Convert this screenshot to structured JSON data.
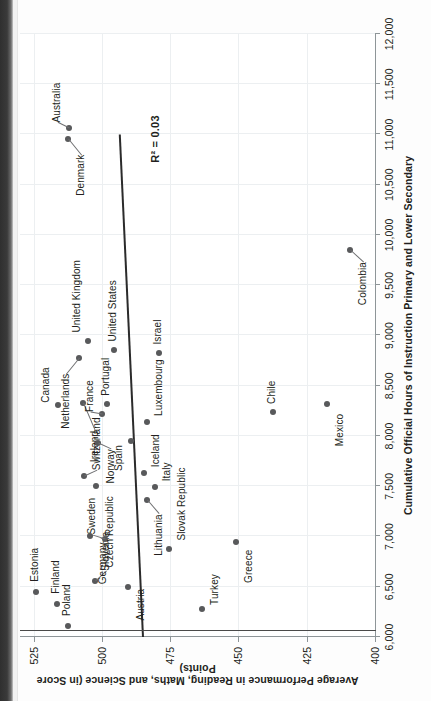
{
  "chart_data": {
    "type": "scatter",
    "title": "",
    "xlabel": "Cumulative Official Hours of Instruction Primary and Lower Secondary",
    "ylabel": "Average Performance in Reading, Maths, and Science (in Score Points)",
    "xlim": [
      6000,
      12000
    ],
    "ylim": [
      400,
      530
    ],
    "xticks": [
      "6,000",
      "6,500",
      "7,000",
      "7,500",
      "8,000",
      "8,500",
      "9,000",
      "9,500",
      "10,000",
      "10,500",
      "11,000",
      "11,500",
      "12,000"
    ],
    "xtick_values": [
      6000,
      6500,
      7000,
      7500,
      8000,
      8500,
      9000,
      9500,
      10000,
      10500,
      11000,
      11500,
      12000
    ],
    "yticks": [
      "400",
      "425",
      "450",
      "475",
      "500",
      "525"
    ],
    "ytick_values": [
      400,
      425,
      450,
      475,
      500,
      525
    ],
    "grid": true,
    "legend": "none",
    "annotation": "R² = 0.03",
    "trendline": {
      "x0": 6000,
      "y0": 485.5,
      "x1": 11000,
      "y1": 494.0
    },
    "refline": {
      "x": 6000,
      "note": "vertical axis guide at left edge of plot"
    },
    "points": [
      {
        "label": "Estonia",
        "x": 6450,
        "y": 524.0,
        "label_dx": 10,
        "label_dy": -1,
        "leader": false
      },
      {
        "label": "Finland",
        "x": 6330,
        "y": 516.5,
        "label_dx": 10,
        "label_dy": -1,
        "leader": false
      },
      {
        "label": "Poland",
        "x": 6110,
        "y": 512.5,
        "label_dx": 10,
        "label_dy": -1,
        "leader": false
      },
      {
        "label": "Canada",
        "x": 8310,
        "y": 516.0,
        "label_dx": 2,
        "label_dy": -12,
        "leader": false
      },
      {
        "label": "Slovenia",
        "x": 6560,
        "y": 502.5,
        "label_dx": 10,
        "label_dy": 11,
        "leader": true
      },
      {
        "label": "Sweden",
        "x": 6980,
        "y": 499.0,
        "label_dx": 4,
        "label_dy": -13,
        "leader": true
      },
      {
        "label": "Germany",
        "x": 7000,
        "y": 504.5,
        "label_dx": -6,
        "label_dy": 13,
        "leader": false
      },
      {
        "label": "Switzerland",
        "x": 7600,
        "y": 506.5,
        "label_dx": 6,
        "label_dy": 13,
        "leader": true
      },
      {
        "label": "Czech Republic",
        "x": 7500,
        "y": 502.0,
        "label_dx": -10,
        "label_dy": 14,
        "leader": false
      },
      {
        "label": "Ireland",
        "x": 8330,
        "y": 507.0,
        "label_dx": -28,
        "label_dy": 12,
        "leader": true
      },
      {
        "label": "Netherlands",
        "x": 8780,
        "y": 508.5,
        "label_dx": -16,
        "label_dy": -13,
        "leader": true
      },
      {
        "label": "United Kingdom",
        "x": 8950,
        "y": 505.0,
        "label_dx": 8,
        "label_dy": -11,
        "leader": false
      },
      {
        "label": "Norway",
        "x": 7930,
        "y": 501.5,
        "label_dx": -6,
        "label_dy": 13,
        "leader": true
      },
      {
        "label": "France",
        "x": 8220,
        "y": 500.0,
        "label_dx": 2,
        "label_dy": -12,
        "leader": true
      },
      {
        "label": "Portugal",
        "x": 8320,
        "y": 498.0,
        "label_dx": 8,
        "label_dy": -1,
        "leader": false
      },
      {
        "label": "United States",
        "x": 8860,
        "y": 495.5,
        "label_dx": 8,
        "label_dy": -1,
        "leader": false
      },
      {
        "label": "Austria",
        "x": 6500,
        "y": 490.5,
        "label_dx": -2,
        "label_dy": 13,
        "leader": false
      },
      {
        "label": "Lithuania",
        "x": 7360,
        "y": 483.5,
        "label_dx": -14,
        "label_dy": 12,
        "leader": true
      },
      {
        "label": "Italy",
        "x": 7490,
        "y": 480.5,
        "label_dx": 6,
        "label_dy": 12,
        "leader": false
      },
      {
        "label": "Iceland",
        "x": 7630,
        "y": 484.5,
        "label_dx": 6,
        "label_dy": 12,
        "leader": false
      },
      {
        "label": "Spain",
        "x": 7950,
        "y": 489.5,
        "label_dx": -4,
        "label_dy": -12,
        "leader": false
      },
      {
        "label": "Slovak Republic",
        "x": 6880,
        "y": 475.5,
        "label_dx": 8,
        "label_dy": 13,
        "leader": false
      },
      {
        "label": "Luxembourg",
        "x": 8140,
        "y": 483.5,
        "label_dx": 6,
        "label_dy": 12,
        "leader": false
      },
      {
        "label": "Israel",
        "x": 8830,
        "y": 479.0,
        "label_dx": 8,
        "label_dy": -1,
        "leader": false
      },
      {
        "label": "Turkey",
        "x": 6280,
        "y": 463.5,
        "label_dx": 4,
        "label_dy": 13,
        "leader": false
      },
      {
        "label": "Greece",
        "x": 6950,
        "y": 451.0,
        "label_dx": -8,
        "label_dy": 13,
        "leader": false
      },
      {
        "label": "Chile",
        "x": 8240,
        "y": 437.5,
        "label_dx": 8,
        "label_dy": -1,
        "leader": false
      },
      {
        "label": "Mexico",
        "x": 8320,
        "y": 417.5,
        "label_dx": -10,
        "label_dy": 13,
        "leader": false
      },
      {
        "label": "Colombia",
        "x": 9850,
        "y": 409.0,
        "label_dx": -12,
        "label_dy": 13,
        "leader": true
      },
      {
        "label": "Denmark",
        "x": 10960,
        "y": 512.5,
        "label_dx": -16,
        "label_dy": 13,
        "leader": true
      },
      {
        "label": "Australia",
        "x": 11060,
        "y": 512.0,
        "label_dx": 6,
        "label_dy": -12,
        "leader": true
      }
    ]
  }
}
